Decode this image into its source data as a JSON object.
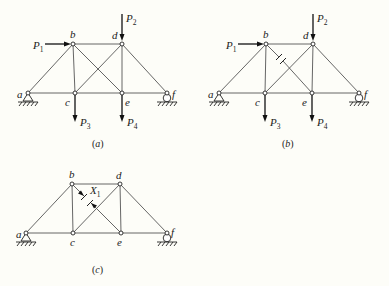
{
  "figure": {
    "panels": [
      {
        "id": "a",
        "caption_open": "(",
        "caption": "a",
        "caption_close": ")",
        "nodes": {
          "a": "a",
          "b": "b",
          "c": "c",
          "d": "d",
          "e": "e",
          "f": "f"
        },
        "loads": {
          "P1": {
            "main": "P",
            "sub": "1"
          },
          "P2": {
            "main": "P",
            "sub": "2"
          },
          "P3": {
            "main": "P",
            "sub": "3"
          },
          "P4": {
            "main": "P",
            "sub": "4"
          }
        }
      },
      {
        "id": "b",
        "caption_open": "(",
        "caption": "b",
        "caption_close": ")",
        "nodes": {
          "a": "a",
          "b": "b",
          "c": "c",
          "d": "d",
          "e": "e",
          "f": "f"
        },
        "loads": {
          "P1": {
            "main": "P",
            "sub": "1"
          },
          "P2": {
            "main": "P",
            "sub": "2"
          },
          "P3": {
            "main": "P",
            "sub": "3"
          },
          "P4": {
            "main": "P",
            "sub": "4"
          }
        },
        "cut_member": "b-e"
      },
      {
        "id": "c",
        "caption_open": "(",
        "caption": "c",
        "caption_close": ")",
        "nodes": {
          "a": "a",
          "b": "b",
          "c": "c",
          "d": "d",
          "e": "e",
          "f": "f"
        },
        "redundant": {
          "main": "X",
          "sub": "1"
        },
        "cut_member": "b-e"
      }
    ]
  }
}
